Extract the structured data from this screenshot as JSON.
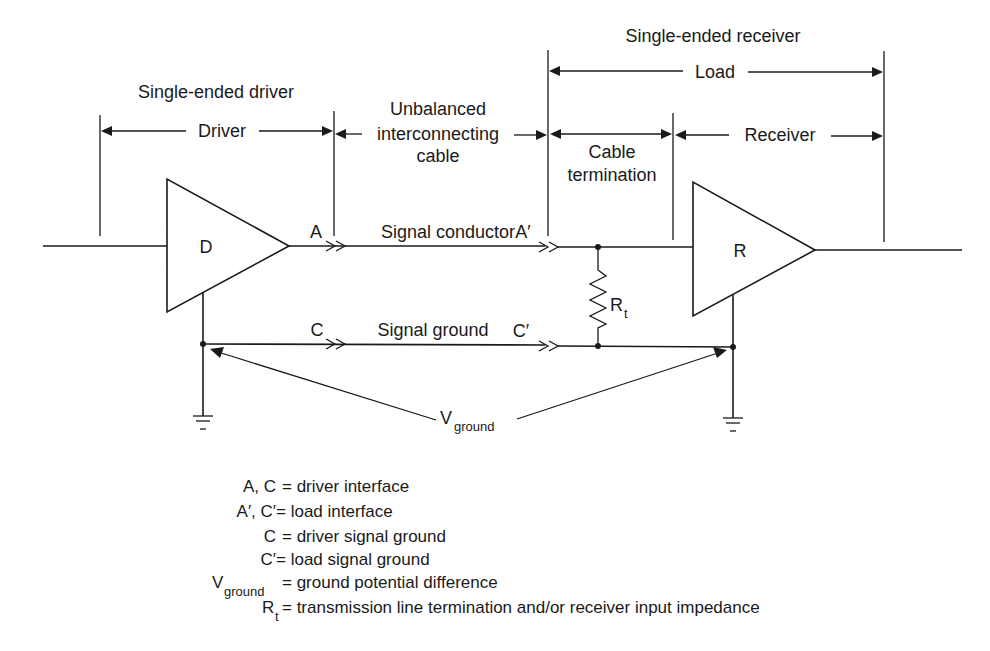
{
  "headers": {
    "driver_group": "Single-ended driver",
    "receiver_group": "Single-ended receiver"
  },
  "spans": {
    "driver": "Driver",
    "cable_line1": "Unbalanced",
    "cable_line2": "interconnecting",
    "cable_line3": "cable",
    "load": "Load",
    "termination_line1": "Cable",
    "termination_line2": "termination",
    "receiver": "Receiver"
  },
  "components": {
    "driver_symbol": "D",
    "receiver_symbol": "R",
    "resistor_main": "R",
    "resistor_sub": "t"
  },
  "nodes": {
    "a": "A",
    "c": "C",
    "a_prime": "A′",
    "c_prime": "C′"
  },
  "conductors": {
    "signal": "Signal conductor",
    "ground": "Signal ground"
  },
  "vground": {
    "main": "V",
    "sub": "ground"
  },
  "legend": [
    {
      "term_main": "A, C",
      "term_sub": "",
      "definition": "= driver interface"
    },
    {
      "term_main": "A′, C′",
      "term_sub": "",
      "definition": "= load interface"
    },
    {
      "term_main": "C",
      "term_sub": "",
      "definition": "= driver signal ground"
    },
    {
      "term_main": "C′",
      "term_sub": "",
      "definition": "= load signal ground"
    },
    {
      "term_main": "V",
      "term_sub": "ground",
      "definition": "= ground potential difference"
    },
    {
      "term_main": "R",
      "term_sub": "t",
      "definition": "= transmission line termination and/or receiver input impedance"
    }
  ]
}
